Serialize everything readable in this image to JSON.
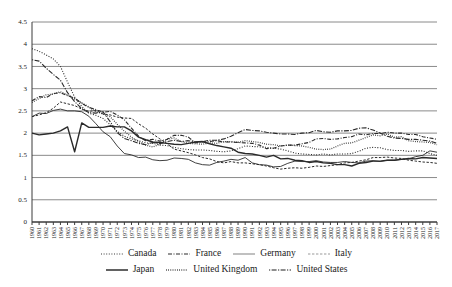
{
  "chart_data": {
    "type": "line",
    "title": "",
    "subtitle": "",
    "xlabel": "",
    "ylabel": "",
    "xlim": [
      1960,
      2017
    ],
    "ylim": [
      0,
      4.5
    ],
    "yticks": [
      0,
      0.5,
      1,
      1.5,
      2,
      2.5,
      3,
      3.5,
      4,
      4.5
    ],
    "ytick_labels": [
      "0",
      "0.5",
      "1",
      "1.5",
      "2",
      "2.5",
      "3",
      "3.5",
      "4",
      "4.5"
    ],
    "grid": true,
    "legend_position": "bottom",
    "x": [
      1960,
      1961,
      1962,
      1963,
      1964,
      1965,
      1966,
      1967,
      1968,
      1969,
      1970,
      1971,
      1972,
      1973,
      1974,
      1975,
      1976,
      1977,
      1978,
      1979,
      1980,
      1981,
      1982,
      1983,
      1984,
      1985,
      1986,
      1987,
      1988,
      1989,
      1990,
      1991,
      1992,
      1993,
      1994,
      1995,
      1996,
      1997,
      1998,
      1999,
      2000,
      2001,
      2002,
      2003,
      2004,
      2005,
      2006,
      2007,
      2008,
      2009,
      2010,
      2011,
      2012,
      2013,
      2014,
      2015,
      2016,
      2017
    ],
    "xtick_labels": [
      "1960",
      "1961",
      "1962",
      "1963",
      "1964",
      "1965",
      "1966",
      "1967",
      "1968",
      "1969",
      "1970",
      "1971",
      "1972",
      "1973",
      "1974",
      "1975",
      "1976",
      "1977",
      "1978",
      "1979",
      "1980",
      "1981",
      "1982",
      "1983",
      "1984",
      "1985",
      "1986",
      "1987",
      "1988",
      "1989",
      "1990",
      "1991",
      "1992",
      "1993",
      "1994",
      "1995",
      "1996",
      "1997",
      "1998",
      "1999",
      "2000",
      "2001",
      "2002",
      "2003",
      "2004",
      "2005",
      "2006",
      "2007",
      "2008",
      "2009",
      "2010",
      "2011",
      "2012",
      "2013",
      "2014",
      "2015",
      "2016",
      "2017"
    ],
    "series": [
      {
        "name": "Canada",
        "line_style": "dotted",
        "dasharray": "1,1.6",
        "width": 1.1,
        "color": "#3a3a3a",
        "values": [
          3.9,
          3.84,
          3.76,
          3.67,
          3.5,
          3.15,
          2.81,
          2.6,
          2.45,
          2.4,
          2.33,
          2.19,
          2.04,
          1.93,
          1.87,
          1.83,
          1.78,
          1.77,
          1.73,
          1.72,
          1.68,
          1.65,
          1.63,
          1.62,
          1.62,
          1.61,
          1.59,
          1.58,
          1.6,
          1.65,
          1.71,
          1.7,
          1.69,
          1.68,
          1.66,
          1.64,
          1.6,
          1.55,
          1.53,
          1.52,
          1.51,
          1.53,
          1.51,
          1.53,
          1.53,
          1.54,
          1.59,
          1.66,
          1.68,
          1.67,
          1.63,
          1.61,
          1.61,
          1.59,
          1.6,
          1.6,
          1.54,
          1.5
        ]
      },
      {
        "name": "France",
        "line_style": "dash-dot",
        "dasharray": "4,1.5,1,1.5",
        "width": 1.1,
        "color": "#2a2a2a",
        "values": [
          2.73,
          2.82,
          2.8,
          2.89,
          2.91,
          2.84,
          2.79,
          2.67,
          2.58,
          2.53,
          2.47,
          2.49,
          2.41,
          2.3,
          2.11,
          1.93,
          1.83,
          1.86,
          1.82,
          1.86,
          1.95,
          1.95,
          1.91,
          1.78,
          1.8,
          1.81,
          1.83,
          1.8,
          1.8,
          1.79,
          1.78,
          1.77,
          1.73,
          1.65,
          1.66,
          1.71,
          1.73,
          1.73,
          1.76,
          1.79,
          1.87,
          1.88,
          1.86,
          1.87,
          1.9,
          1.92,
          1.98,
          1.96,
          1.99,
          1.99,
          2.02,
          2.0,
          2.0,
          1.97,
          1.97,
          1.92,
          1.89,
          1.86
        ]
      },
      {
        "name": "Germany",
        "line_style": "solid",
        "dasharray": "",
        "width": 0.9,
        "color": "#8c8c8c",
        "values": [
          2.37,
          2.45,
          2.44,
          2.51,
          2.54,
          2.5,
          2.5,
          2.48,
          2.38,
          2.21,
          2.03,
          1.92,
          1.71,
          1.54,
          1.51,
          1.45,
          1.46,
          1.4,
          1.38,
          1.39,
          1.44,
          1.43,
          1.41,
          1.33,
          1.29,
          1.28,
          1.34,
          1.37,
          1.41,
          1.39,
          1.45,
          1.33,
          1.29,
          1.28,
          1.24,
          1.25,
          1.32,
          1.37,
          1.36,
          1.36,
          1.38,
          1.35,
          1.34,
          1.34,
          1.36,
          1.34,
          1.33,
          1.37,
          1.38,
          1.36,
          1.39,
          1.39,
          1.41,
          1.42,
          1.47,
          1.5,
          1.6,
          1.57
        ]
      },
      {
        "name": "Italy",
        "line_style": "dashed",
        "dasharray": "2.4,1.6",
        "width": 1.0,
        "color": "#9a9a9a",
        "values": [
          2.37,
          2.41,
          2.46,
          2.56,
          2.7,
          2.66,
          2.62,
          2.54,
          2.49,
          2.51,
          2.43,
          2.41,
          2.36,
          2.34,
          2.33,
          2.21,
          2.11,
          1.98,
          1.87,
          1.76,
          1.64,
          1.6,
          1.56,
          1.51,
          1.45,
          1.42,
          1.36,
          1.33,
          1.36,
          1.33,
          1.33,
          1.31,
          1.29,
          1.26,
          1.22,
          1.19,
          1.21,
          1.22,
          1.21,
          1.23,
          1.26,
          1.25,
          1.27,
          1.29,
          1.33,
          1.34,
          1.37,
          1.4,
          1.45,
          1.45,
          1.46,
          1.44,
          1.43,
          1.39,
          1.37,
          1.35,
          1.34,
          1.32
        ]
      },
      {
        "name": "Japan",
        "line_style": "solid",
        "dasharray": "",
        "width": 1.4,
        "color": "#1f1f1f",
        "values": [
          2.0,
          1.96,
          1.98,
          2.0,
          2.05,
          2.14,
          1.58,
          2.23,
          2.13,
          2.13,
          2.13,
          2.16,
          2.14,
          2.14,
          2.05,
          1.91,
          1.85,
          1.8,
          1.79,
          1.77,
          1.75,
          1.74,
          1.77,
          1.8,
          1.81,
          1.76,
          1.72,
          1.69,
          1.66,
          1.57,
          1.54,
          1.53,
          1.5,
          1.46,
          1.5,
          1.42,
          1.43,
          1.39,
          1.38,
          1.34,
          1.36,
          1.33,
          1.32,
          1.29,
          1.29,
          1.26,
          1.32,
          1.34,
          1.37,
          1.37,
          1.39,
          1.39,
          1.41,
          1.43,
          1.42,
          1.45,
          1.44,
          1.43
        ]
      },
      {
        "name": "United Kingdom",
        "line_style": "dotted",
        "dasharray": "0.8,1.4",
        "width": 1.3,
        "color": "#2f2f2f",
        "values": [
          2.69,
          2.78,
          2.86,
          2.88,
          2.93,
          2.86,
          2.77,
          2.68,
          2.59,
          2.48,
          2.43,
          2.37,
          2.2,
          2.04,
          1.91,
          1.81,
          1.73,
          1.69,
          1.75,
          1.86,
          1.89,
          1.81,
          1.77,
          1.76,
          1.75,
          1.78,
          1.77,
          1.81,
          1.81,
          1.79,
          1.83,
          1.81,
          1.79,
          1.75,
          1.74,
          1.71,
          1.73,
          1.72,
          1.71,
          1.68,
          1.64,
          1.63,
          1.64,
          1.71,
          1.77,
          1.78,
          1.84,
          1.9,
          1.96,
          1.94,
          1.98,
          1.91,
          1.92,
          1.83,
          1.81,
          1.8,
          1.79,
          1.74
        ]
      },
      {
        "name": "United States",
        "line_style": "dash-dot-dash",
        "dasharray": "1.2,1.4,5,1.4",
        "width": 1.1,
        "color": "#1f1f1f",
        "values": [
          3.65,
          3.62,
          3.46,
          3.32,
          3.19,
          2.91,
          2.71,
          2.55,
          2.46,
          2.45,
          2.48,
          2.26,
          2.01,
          1.88,
          1.83,
          1.77,
          1.74,
          1.79,
          1.76,
          1.81,
          1.84,
          1.81,
          1.83,
          1.8,
          1.81,
          1.84,
          1.84,
          1.87,
          1.93,
          2.01,
          2.08,
          2.06,
          2.05,
          2.02,
          2.0,
          1.98,
          1.98,
          1.97,
          2.0,
          2.01,
          2.06,
          2.03,
          2.02,
          2.05,
          2.05,
          2.06,
          2.11,
          2.12,
          2.07,
          2.0,
          1.93,
          1.89,
          1.88,
          1.86,
          1.86,
          1.84,
          1.82,
          1.77
        ]
      }
    ]
  },
  "legend": {
    "row1": [
      {
        "label": "Canada",
        "series_index": 0
      },
      {
        "label": "France",
        "series_index": 1
      },
      {
        "label": "Germany",
        "series_index": 2
      },
      {
        "label": "Italy",
        "series_index": 3
      }
    ],
    "row2": [
      {
        "label": "Japan",
        "series_index": 4
      },
      {
        "label": "United Kingdom",
        "series_index": 5
      },
      {
        "label": "United States",
        "series_index": 6
      }
    ]
  }
}
